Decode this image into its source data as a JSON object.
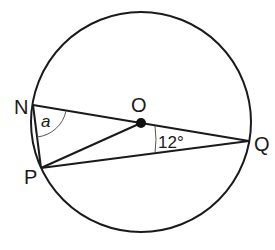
{
  "diagram": {
    "type": "circle-geometry",
    "circle": {
      "cx": 141,
      "cy": 122,
      "r": 110
    },
    "center": {
      "label": "O",
      "x": 141,
      "y": 123
    },
    "points": [
      {
        "label": "N",
        "x": 33,
        "y": 105
      },
      {
        "label": "P",
        "x": 41,
        "y": 168
      },
      {
        "label": "Q",
        "x": 249,
        "y": 141
      }
    ],
    "segments": [
      "N-Q",
      "N-P",
      "P-Q",
      "P-O"
    ],
    "angles": [
      {
        "label": "a",
        "at": "N",
        "between": [
          "P",
          "O"
        ]
      },
      {
        "label": "12°",
        "at": "Q",
        "between": [
          "N",
          "P"
        ]
      }
    ]
  },
  "labels": {
    "N": "N",
    "P": "P",
    "Q": "Q",
    "O": "O",
    "angle_a": "a",
    "angle_q": "12°"
  }
}
